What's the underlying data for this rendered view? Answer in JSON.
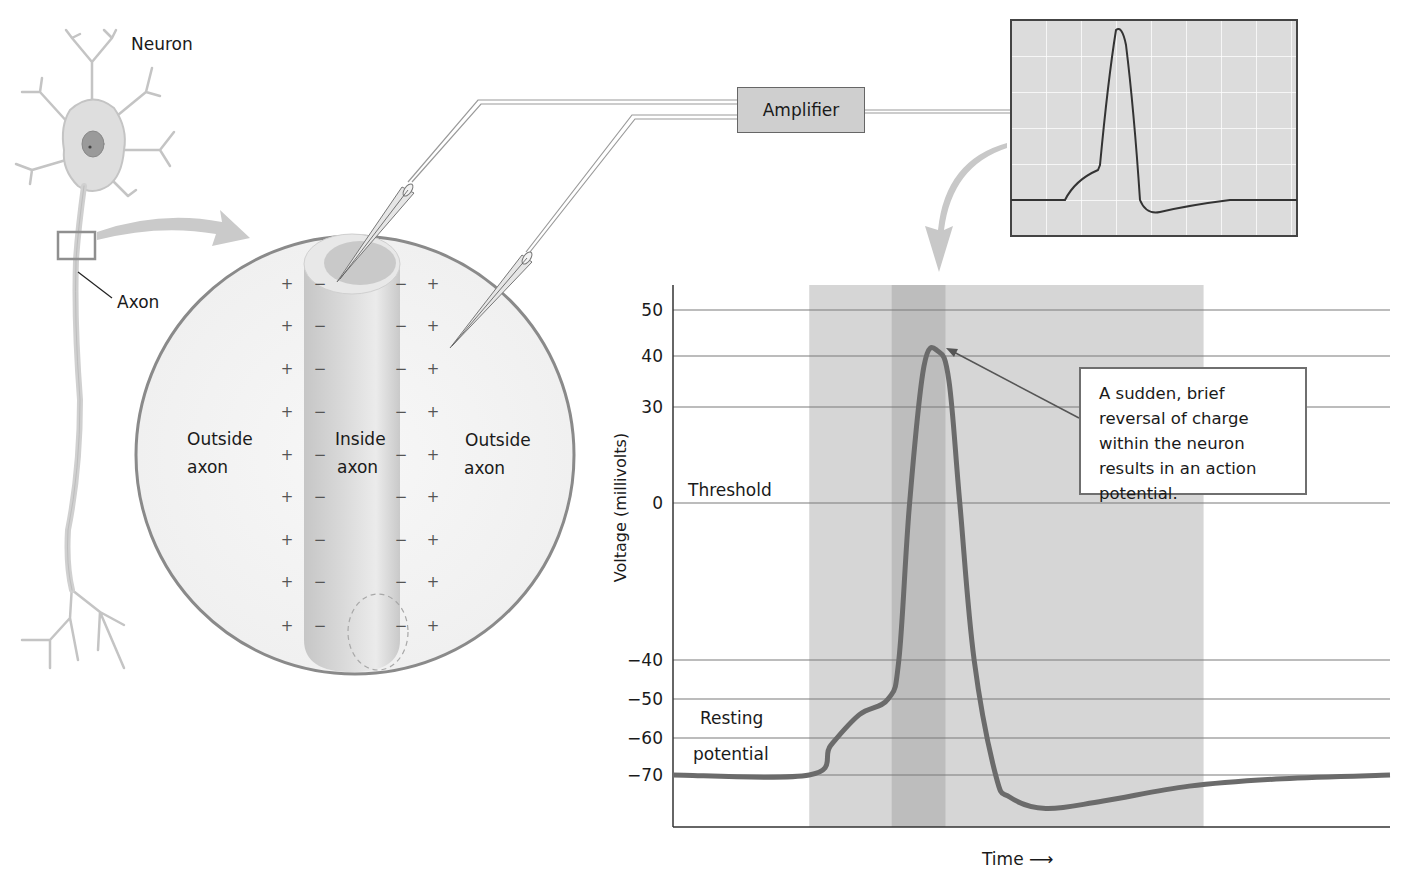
{
  "labels": {
    "neuron": "Neuron",
    "axon": "Axon",
    "outside_left_line1": "Outside",
    "outside_left_line2": "axon",
    "inside_line1": "Inside",
    "inside_line2": "axon",
    "outside_right_line1": "Outside",
    "outside_right_line2": "axon",
    "amplifier": "Amplifier",
    "threshold": "Threshold",
    "resting_line1": "Resting",
    "resting_line2": "potential",
    "callout": "A sudden, brief reversal of charge within the neuron results in an action potential.",
    "ylabel": "Voltage (millivolts)",
    "xlabel": "Time",
    "plus_sign": "+",
    "minus_sign": "−"
  },
  "colors": {
    "curve": "#6b6b6b",
    "gridline": "#7a7a7a",
    "band_light": "#d6d6d6",
    "band_dark": "#bdbdbd",
    "circle_border": "#8a8a8a",
    "oscilloscope_bg": "#dcdcdc",
    "amplifier_bg": "#cfcfcf"
  },
  "chart_data": {
    "type": "line",
    "title": "",
    "xlabel": "Time",
    "ylabel": "Voltage (millivolts)",
    "yticks": [
      50,
      40,
      30,
      0,
      -40,
      -50,
      -60,
      -70
    ],
    "ylim": [
      -84,
      55
    ],
    "grid": "horizontal lines at each tick",
    "annotations": [
      {
        "text": "Threshold",
        "near_y": 0
      },
      {
        "text": "Resting potential",
        "near_y": -65
      },
      {
        "text": "A sudden, brief reversal of charge within the neuron results in an action potential.",
        "points_to": "peak"
      }
    ],
    "series": [
      {
        "name": "membrane potential",
        "x": [
          0,
          19,
          22,
          26,
          30,
          31.5,
          33,
          35,
          37,
          38.5,
          40,
          42,
          45,
          47,
          52,
          60,
          72,
          85,
          100
        ],
        "y": [
          -70,
          -70,
          -62,
          -54,
          -50,
          -40,
          0,
          38,
          41,
          35,
          0,
          -40,
          -70,
          -76,
          -79,
          -77,
          -73,
          -71,
          -70
        ]
      }
    ],
    "shaded_regions": [
      {
        "x_from": 19,
        "x_to": 74,
        "shade": "light"
      },
      {
        "x_from": 30.5,
        "x_to": 38,
        "shade": "dark"
      }
    ]
  }
}
